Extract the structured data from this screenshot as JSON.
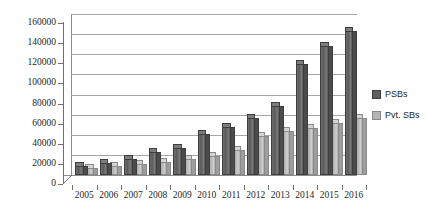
{
  "chart_data": {
    "type": "bar",
    "title": "",
    "subtitle": "",
    "xlabel": "",
    "ylabel": "",
    "categories": [
      "2005",
      "2006",
      "2007",
      "2008",
      "2009",
      "2010",
      "2011",
      "2012",
      "2013",
      "2014",
      "2015",
      "2016"
    ],
    "series": [
      {
        "name": "PSBs",
        "color": "#5f5f5f",
        "values": [
          9000,
          12000,
          16000,
          23000,
          27000,
          41000,
          48000,
          57000,
          69000,
          110000,
          128000,
          143000
        ]
      },
      {
        "name": "Pvt. SBs",
        "color": "#b4b4b4",
        "values": [
          7000,
          9000,
          11000,
          13000,
          16000,
          19000,
          25000,
          39000,
          44000,
          47000,
          52000,
          57000
        ]
      }
    ],
    "ylim": [
      0,
      160000
    ],
    "ytick_step": 20000,
    "yticks": [
      0,
      20000,
      40000,
      60000,
      80000,
      100000,
      120000,
      140000,
      160000
    ],
    "ytick_labels": [
      "0",
      "20000",
      "40000",
      "60000",
      "80000",
      "100000",
      "120000",
      "140000",
      "160000"
    ],
    "grid": true,
    "grid_axis": "y",
    "legend_position": "right",
    "style": "3d-column"
  },
  "legend": {
    "items": [
      {
        "label": "PSBs",
        "swatch": "psb"
      },
      {
        "label": "Pvt. SBs",
        "swatch": "pvt"
      }
    ]
  }
}
